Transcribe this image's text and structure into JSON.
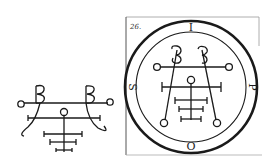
{
  "figure": {
    "left_seal": {
      "label": "simple-seal-variant"
    },
    "right_seal": {
      "plate_number": "26.",
      "ring_letters": {
        "top": "I",
        "right": "P",
        "bottom": "O",
        "left": "S"
      }
    }
  },
  "colors": {
    "ink": "#1a1a1a",
    "paper": "#ffffff",
    "frame": "#999999"
  }
}
